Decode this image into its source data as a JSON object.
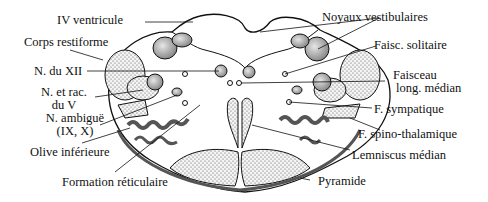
{
  "diagram": {
    "labels": {
      "iv_ventricule": "IV ventricule",
      "corps_restiforme": "Corps restiforme",
      "n_du_xii": "N. du XII",
      "n_et_rac_l1": "N. et rac.",
      "n_et_rac_l2": "du V",
      "n_ambigue_l1": "N. ambiguë",
      "n_ambigue_l2": "(IX, X)",
      "olive_inferieure": "Olive inférieure",
      "formation_reticulaire": "Formation réticulaire",
      "noyaux_vestibulaires": "Noyaux vestibulaires",
      "faisc_solitaire": "Faisc. solitaire",
      "faisceau_l1": "Faisceau",
      "faisceau_l2": "long. médian",
      "f_sympatique": "F. sympatique",
      "f_spino_thalamique": "F. spino-thalamique",
      "lemniscus_median": "Lemniscus médian",
      "pyramide": "Pyramide"
    }
  }
}
